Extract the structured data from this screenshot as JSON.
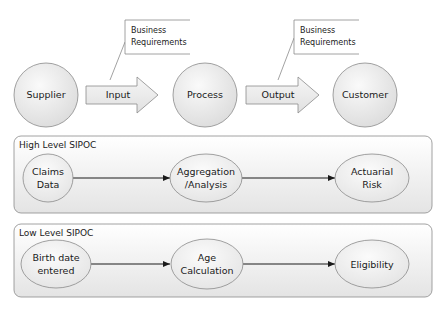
{
  "top_row": {
    "supplier": "Supplier",
    "input": "Input",
    "process": "Process",
    "output": "Output",
    "customer": "Customer",
    "callout_input": [
      "Business",
      "Requirements"
    ],
    "callout_output": [
      "Business",
      "Requirements"
    ]
  },
  "high_level": {
    "title": "High Level SIPOC",
    "nodes": [
      [
        "Claims",
        "Data"
      ],
      [
        "Aggregation",
        "/Analysis"
      ],
      [
        "Actuarial",
        "Risk"
      ]
    ]
  },
  "low_level": {
    "title": "Low Level SIPOC",
    "nodes": [
      [
        "Birth date",
        "entered"
      ],
      [
        "Age",
        "Calculation"
      ],
      [
        "Eligibility"
      ]
    ]
  },
  "colors": {
    "stroke": "#8a8a8a",
    "fill_light": "#f7f7f7",
    "fill_dark": "#dedede",
    "connector": "#1a1a1a"
  }
}
